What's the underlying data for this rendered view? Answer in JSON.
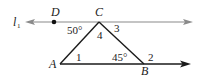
{
  "diagram": {
    "type": "geometry",
    "line_label": "l",
    "line_label_subscript": "1",
    "points": {
      "D": {
        "label": "D",
        "x": 54,
        "y": 22
      },
      "C": {
        "label": "C",
        "x": 99,
        "y": 22
      },
      "A": {
        "label": "A",
        "x": 60,
        "y": 64
      },
      "B": {
        "label": "B",
        "x": 144,
        "y": 64
      }
    },
    "angle_labels": {
      "dcA": "50°",
      "angle4": "4",
      "angle3": "3",
      "angle1": "1",
      "abc": "45°",
      "angle2": "2"
    },
    "colors": {
      "line_l1": "#8a8a8a",
      "triangle": "#1a1a1a",
      "ray_ab": "#1a1a1a",
      "text": "#222222"
    }
  }
}
